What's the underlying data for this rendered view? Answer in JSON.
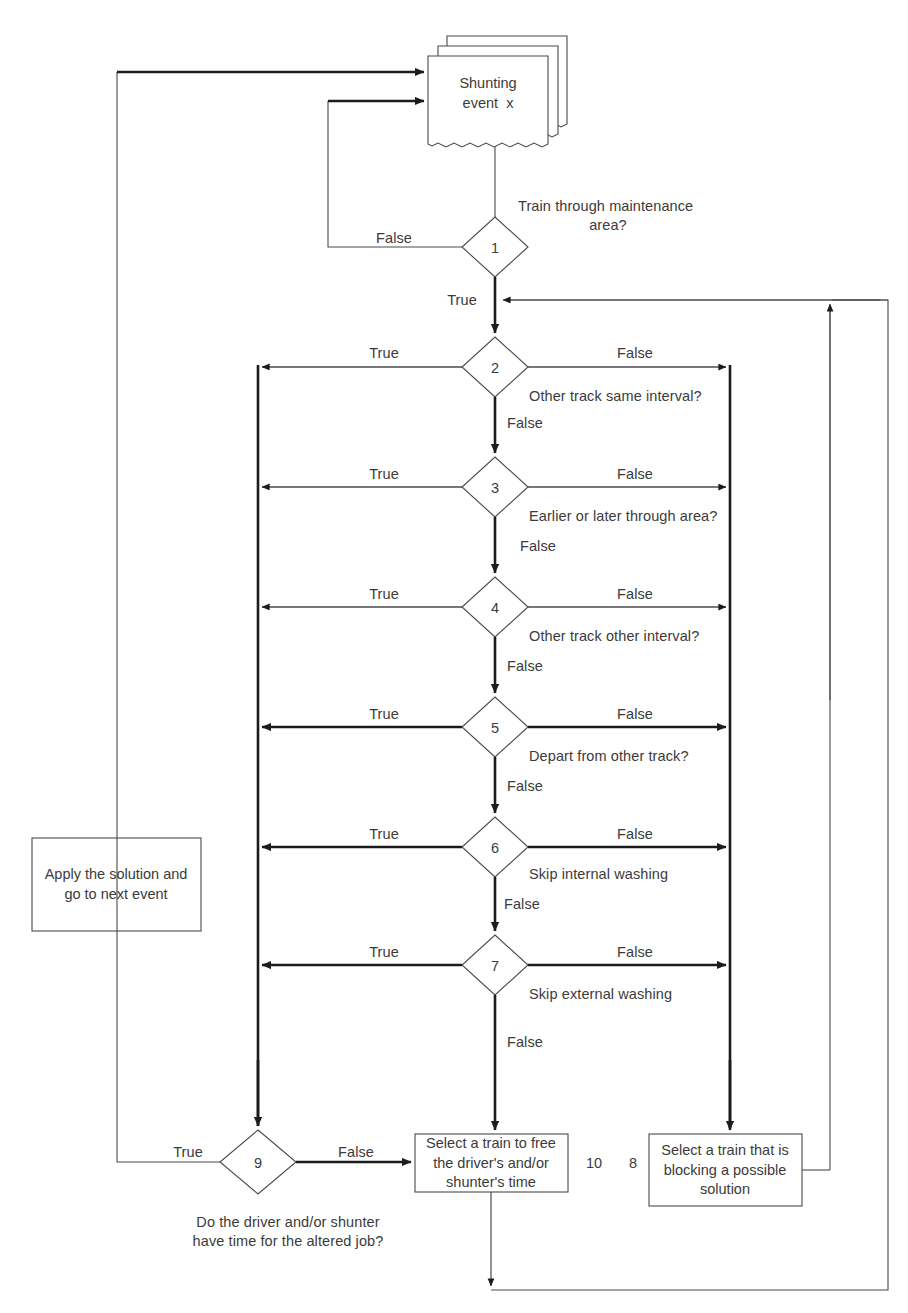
{
  "diagram": {
    "type": "flowchart",
    "document": {
      "line1": "Shunting",
      "line2": "event  x"
    },
    "decisions": [
      {
        "id": "1",
        "number": "1",
        "question": "Train through maintenance\narea?",
        "true_label": "True",
        "false_label": "False"
      },
      {
        "id": "2",
        "number": "2",
        "question": "Other track same interval?",
        "true_label": "True",
        "false_label": "False",
        "down_label": "False"
      },
      {
        "id": "3",
        "number": "3",
        "question": "Earlier or later through area?",
        "true_label": "True",
        "false_label": "False",
        "down_label": "False"
      },
      {
        "id": "4",
        "number": "4",
        "question": "Other track other interval?",
        "true_label": "True",
        "false_label": "False",
        "down_label": "False"
      },
      {
        "id": "5",
        "number": "5",
        "question": "Depart from other track?",
        "true_label": "True",
        "false_label": "False",
        "down_label": "False"
      },
      {
        "id": "6",
        "number": "6",
        "question": "Skip internal washing",
        "true_label": "True",
        "false_label": "False",
        "down_label": "False"
      },
      {
        "id": "7",
        "number": "7",
        "question": "Skip external washing",
        "true_label": "True",
        "false_label": "False",
        "down_label": "False"
      },
      {
        "id": "9",
        "number": "9",
        "question": "Do the driver and/or shunter\nhave time for the altered job?",
        "true_label": "True",
        "false_label": "False"
      }
    ],
    "processes": [
      {
        "id": "apply",
        "text": "Apply the solution and\ngo to next event",
        "number": ""
      },
      {
        "id": "10",
        "text": "Select a train to free\nthe driver's and/or\nshunter's time",
        "number": "10"
      },
      {
        "id": "8",
        "text": "Select a train that is\nblocking a possible\nsolution",
        "number": "8"
      }
    ],
    "labels": {
      "d1_question_l1": "Train through maintenance",
      "d1_question_l2": "area?",
      "d1_false": "False",
      "d1_true": "True",
      "d2_true": "True",
      "d2_false": "False",
      "d2_question": "Other track same interval?",
      "d2_down": "False",
      "d3_true": "True",
      "d3_false": "False",
      "d3_question": "Earlier or later through area?",
      "d3_down": "False",
      "d4_true": "True",
      "d4_false": "False",
      "d4_question": "Other track other interval?",
      "d4_down": "False",
      "d5_true": "True",
      "d5_false": "False",
      "d5_question": "Depart from other track?",
      "d5_down": "False",
      "d6_true": "True",
      "d6_false": "False",
      "d6_question": "Skip internal washing",
      "d6_down": "False",
      "d7_true": "True",
      "d7_false": "False",
      "d7_question": "Skip external washing",
      "d7_down": "False",
      "d9_true": "True",
      "d9_false": "False",
      "d9_question_l1": "Do the driver and/or shunter",
      "d9_question_l2": "have time for the altered job?",
      "box10_number": "10",
      "box8_number": "8",
      "box_apply_l1": "Apply the solution and",
      "box_apply_l2": "go to next event",
      "box10_l1": "Select a train to free",
      "box10_l2": "the driver's and/or",
      "box10_l3": "shunter's time",
      "box8_l1": "Select a train that is",
      "box8_l2": "blocking a possible",
      "box8_l3": "solution",
      "doc_l1": "Shunting",
      "doc_l2": "event  x",
      "num1": "1",
      "num2": "2",
      "num3": "3",
      "num4": "4",
      "num5": "5",
      "num6": "6",
      "num7": "7",
      "num9": "9"
    },
    "colors": {
      "stroke": "#4a4a4a",
      "stroke_bold": "#1c1c1c",
      "text": "#3b3b3b",
      "background": "#ffffff"
    }
  }
}
